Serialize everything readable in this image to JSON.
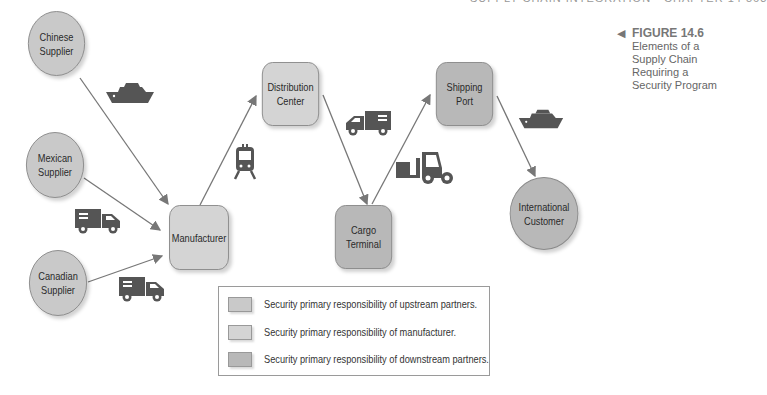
{
  "header": {
    "text": "SUPPLY CHAIN INTEGRATION  •  CHAPTER 14     563"
  },
  "caption": {
    "figure_label": "FIGURE 14.6",
    "title_line1": "Elements of a Supply Chain",
    "title_line2": "Requiring a Security Program"
  },
  "nodes": {
    "chinese_supplier": "Chinese\nSupplier",
    "mexican_supplier": "Mexican\nSupplier",
    "canadian_supplier": "Canadian\nSupplier",
    "manufacturer": "Manufacturer",
    "distribution_center": "Distribution\nCenter",
    "cargo_terminal": "Cargo\nTerminal",
    "shipping_port": "Shipping\nPort",
    "international_customer": "International\nCustomer"
  },
  "legend": {
    "items": [
      {
        "label": "Security primary responsibility of upstream partners.",
        "color": "#c9c9c9"
      },
      {
        "label": "Security primary responsibility of manufacturer.",
        "color": "#d4d4d4"
      },
      {
        "label": "Security primary responsibility of downstream partners.",
        "color": "#b8b8b8"
      }
    ]
  },
  "icons": {
    "chinese_to_manufacturer": "ship-icon",
    "mexican_to_manufacturer": "truck-icon",
    "canadian_to_manufacturer": "truck-icon",
    "manufacturer_to_distribution": "train-icon",
    "distribution_to_cargo": "truck-icon",
    "cargo_to_port": "forklift-icon",
    "port_to_customer": "ship-icon"
  },
  "colors": {
    "upstream": "#c9c9c9",
    "manufacturer": "#d4d4d4",
    "downstream": "#b8b8b8",
    "icon": "#555555",
    "line": "#777777"
  }
}
